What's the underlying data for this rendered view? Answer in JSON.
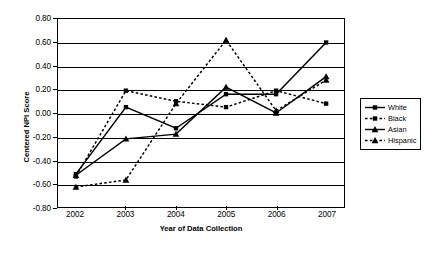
{
  "chart_data": {
    "type": "line",
    "title": "",
    "xlabel": "Year of Data Collection",
    "ylabel": "Centered NPI Score",
    "x": [
      2002,
      2003,
      2004,
      2005,
      2006,
      2007
    ],
    "categories": [
      "2002",
      "2003",
      "2004",
      "2005",
      "2006",
      "2007"
    ],
    "ylim": [
      -0.8,
      0.8
    ],
    "yticks": [
      "0.80",
      "0.60",
      "0.40",
      "0.20",
      "0.00",
      "-0.20",
      "-0.40",
      "-0.60",
      "-0.80"
    ],
    "ytick_values": [
      0.8,
      0.6,
      0.4,
      0.2,
      0.0,
      -0.2,
      -0.4,
      -0.6,
      -0.8
    ],
    "grid": true,
    "legend_position": "right",
    "series": [
      {
        "name": "White",
        "values": [
          -0.52,
          0.05,
          -0.13,
          0.16,
          0.16,
          0.6
        ],
        "line_style": "solid",
        "marker": "square",
        "color": "#000000"
      },
      {
        "name": "Black",
        "values": [
          -0.54,
          0.19,
          0.1,
          0.05,
          0.19,
          0.08
        ],
        "line_style": "dotted",
        "marker": "square",
        "color": "#000000"
      },
      {
        "name": "Asian",
        "values": [
          -0.53,
          -0.22,
          -0.18,
          0.22,
          0.0,
          0.31
        ],
        "line_style": "solid",
        "marker": "triangle",
        "color": "#000000"
      },
      {
        "name": "Hispanic",
        "values": [
          -0.63,
          -0.57,
          0.08,
          0.62,
          0.02,
          0.28
        ],
        "line_style": "dotted",
        "marker": "triangle",
        "color": "#000000"
      }
    ]
  },
  "legend": {
    "items": [
      {
        "label": "White"
      },
      {
        "label": "Black"
      },
      {
        "label": "Asian"
      },
      {
        "label": "Hispanic"
      }
    ]
  },
  "axis": {
    "y_title": "Centered NPI Score",
    "x_title": "Year of Data Collection"
  }
}
